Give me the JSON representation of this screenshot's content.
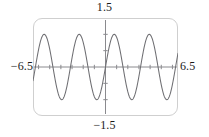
{
  "figure": {
    "kind": "graphing-calculator-plot",
    "width": 209,
    "height": 137
  },
  "labels": {
    "top": "1.5",
    "bottom": "−1.5",
    "left": "−6.5",
    "right": "6.5"
  },
  "colors": {
    "curve": "#6e6e72",
    "axis": "#8a8a8e",
    "frame": "#cfcfcf",
    "label_text": "#1a1a1a",
    "background": "#ffffff"
  },
  "chart_data": {
    "type": "line",
    "title": "",
    "xlabel": "",
    "ylabel": "",
    "xlim": [
      -6.5,
      6.5
    ],
    "ylim": [
      -1.5,
      1.5
    ],
    "grid": false,
    "legend": "none",
    "xtick_labels": [
      "−6.5",
      "6.5"
    ],
    "ytick_labels": [
      "−1.5",
      "1.5"
    ],
    "x_tick_interval": 1,
    "y_tick_interval": 0.5,
    "axes_drawn": [
      "x-axis at y=0",
      "y-axis at x=0"
    ],
    "series": [
      {
        "name": "y = sin(2x)",
        "expression": "sin(2x)",
        "amplitude": 1,
        "period": 3.1416,
        "phase": 0,
        "x": [
          -6.5,
          -6.25,
          -6,
          -5.75,
          -5.5,
          -5.25,
          -5,
          -4.75,
          -4.5,
          -4.25,
          -4,
          -3.75,
          -3.5,
          -3.25,
          -3,
          -2.75,
          -2.5,
          -2.25,
          -2,
          -1.75,
          -1.5,
          -1.25,
          -1,
          -0.75,
          -0.5,
          -0.25,
          0,
          0.25,
          0.5,
          0.75,
          1,
          1.25,
          1.5,
          1.75,
          2,
          2.25,
          2.5,
          2.75,
          3,
          3.25,
          3.5,
          3.75,
          4,
          4.25,
          4.5,
          4.75,
          5,
          5.25,
          5.5,
          5.75,
          6,
          6.25,
          6.5
        ],
        "y": [
          0.2151,
          -0.2794,
          -0.6935,
          -0.954,
          -0.9999,
          -0.8137,
          -0.544,
          -0.1822,
          0.212,
          0.5767,
          0.9894,
          0.9998,
          0.8118,
          0.5413,
          0.2794,
          -0.2151,
          -0.9589,
          -0.9775,
          -0.7568,
          -0.4794,
          -0.1411,
          0.5985,
          0.9093,
          0.9975,
          0.8415,
          0.4794,
          0.0,
          -0.4794,
          -0.8415,
          -0.9975,
          -0.9093,
          -0.5985,
          0.1411,
          0.4794,
          0.7568,
          0.9775,
          0.9589,
          0.2151,
          -0.2794,
          -0.5413,
          -0.8118,
          -0.9998,
          -0.9894,
          -0.5767,
          -0.212,
          0.1822,
          0.544,
          0.8137,
          0.9999,
          0.954,
          0.6935,
          0.2794,
          -0.2151
        ],
        "key_points": {
          "zeros": [
            -6.28,
            -4.71,
            -3.14,
            -1.57,
            0,
            1.57,
            3.14,
            4.71,
            6.28
          ],
          "maxima_x": [
            -5.5,
            -2.36,
            0.79,
            3.93
          ],
          "minima_x": [
            -3.93,
            -0.79,
            2.36,
            5.5
          ],
          "max_value": 1,
          "min_value": -1
        }
      }
    ]
  }
}
